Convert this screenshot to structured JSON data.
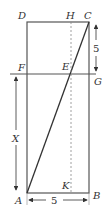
{
  "diagram": {
    "points": {
      "A": {
        "label": "A",
        "x": 27,
        "y": 193
      },
      "B": {
        "label": "B",
        "x": 89,
        "y": 193
      },
      "C": {
        "label": "C",
        "x": 89,
        "y": 22
      },
      "D": {
        "label": "D",
        "x": 27,
        "y": 22
      },
      "E": {
        "label": "E",
        "x": 71,
        "y": 74
      },
      "F": {
        "label": "F",
        "x": 27,
        "y": 74
      },
      "G": {
        "label": "G",
        "x": 89,
        "y": 74
      },
      "H": {
        "label": "H",
        "x": 71,
        "y": 22
      },
      "K": {
        "label": "K",
        "x": 71,
        "y": 193
      }
    },
    "labels": {
      "A": "A",
      "B": "B",
      "C": "C",
      "D": "D",
      "E": "E",
      "F": "F",
      "G": "G",
      "H": "H",
      "K": "K"
    },
    "dimensions": {
      "right_top": "5",
      "left_x": "X",
      "bottom": "5"
    },
    "colors": {
      "line": "#555555",
      "dashed": "#888888",
      "text": "#333333"
    }
  }
}
